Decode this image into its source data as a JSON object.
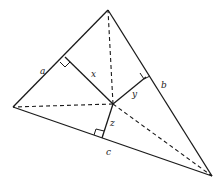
{
  "diagram": {
    "type": "triangle-interior-point-perpendiculars",
    "side_labels": {
      "a": "a",
      "b": "b",
      "c": "c"
    },
    "perpendicular_labels": {
      "x": "x",
      "y": "y",
      "z": "z"
    }
  }
}
